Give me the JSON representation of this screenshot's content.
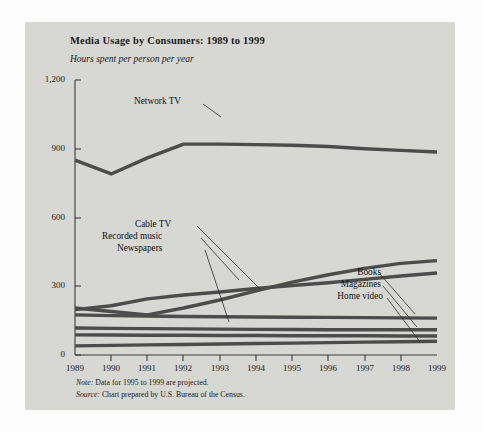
{
  "chart_data": {
    "type": "line",
    "title": "Media Usage by Consumers: 1989 to 1999",
    "subtitle": "Hours spent per person per year",
    "xlabel": "",
    "ylabel": "Hours spent per person per year",
    "grid": false,
    "legend_position": "inline-direct-labels",
    "xlim": [
      1989,
      1999
    ],
    "ylim": [
      0,
      1200
    ],
    "yticks": [
      0,
      300,
      600,
      900,
      1200
    ],
    "ytick_labels": [
      "0",
      "300",
      "600",
      "900",
      "1,200"
    ],
    "categories": [
      1989,
      1990,
      1991,
      1992,
      1993,
      1994,
      1995,
      1996,
      1997,
      1998,
      1999
    ],
    "xtick_labels": [
      "1989",
      "1990",
      "1991",
      "1992",
      "1993",
      "1994",
      "1995",
      "1996",
      "1997",
      "1998",
      "1999"
    ],
    "series": [
      {
        "name": "Network TV",
        "label_side": "top",
        "values": [
          850,
          790,
          860,
          920,
          920,
          918,
          915,
          910,
          900,
          893,
          886
        ]
      },
      {
        "name": "Cable TV",
        "label_side": "left",
        "values": [
          205,
          190,
          175,
          205,
          240,
          280,
          318,
          350,
          378,
          400,
          412
        ]
      },
      {
        "name": "Recorded music",
        "label_side": "left",
        "values": [
          198,
          215,
          245,
          262,
          275,
          290,
          303,
          315,
          330,
          345,
          358
        ]
      },
      {
        "name": "Newspapers",
        "label_side": "left",
        "values": [
          175,
          172,
          170,
          168,
          167,
          166,
          165,
          164,
          163,
          162,
          161
        ]
      },
      {
        "name": "Books",
        "label_side": "right",
        "values": [
          118,
          116,
          115,
          114,
          113,
          112,
          111,
          110,
          110,
          110,
          110
        ]
      },
      {
        "name": "Magazines",
        "label_side": "right",
        "values": [
          88,
          87,
          86,
          86,
          85,
          85,
          84,
          84,
          84,
          83,
          83
        ]
      },
      {
        "name": "Home video",
        "label_side": "right",
        "values": [
          40,
          42,
          44,
          46,
          48,
          50,
          52,
          54,
          56,
          58,
          60
        ]
      }
    ],
    "annotations": {
      "note": "Note: Data for 1995 to 1999 are projected.",
      "note_prefix": "Note:",
      "note_text": "Data for 1995 to 1999 are projected.",
      "source_prefix": "Source:",
      "source_text": "Chart prepared by U.S. Bureau of the Census."
    },
    "colors": {
      "line": "#4c4c4c",
      "panel": "#d7d7d3",
      "axis": "#3b3b3b",
      "text": "#1b1b1b"
    }
  }
}
